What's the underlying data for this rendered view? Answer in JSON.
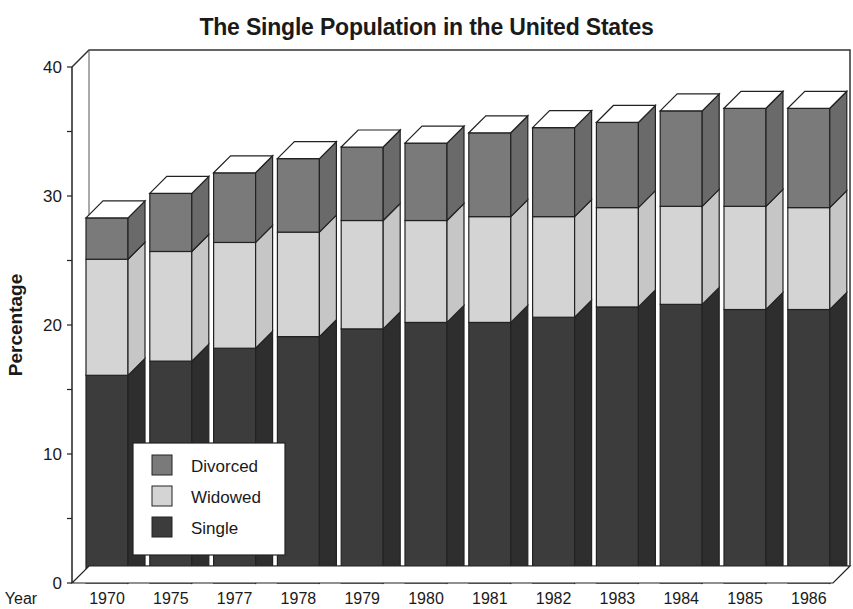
{
  "chart_data": {
    "type": "bar",
    "stacked": true,
    "three_d": true,
    "title": "The Single Population in the United States",
    "xlabel": "Year",
    "ylabel": "Percentage",
    "ylim": [
      0,
      40
    ],
    "yticks": [
      0,
      10,
      20,
      30,
      40
    ],
    "grid": false,
    "legend_position": "lower-left inside plot",
    "categories": [
      "1970",
      "1975",
      "1977",
      "1978",
      "1979",
      "1980",
      "1981",
      "1982",
      "1983",
      "1984",
      "1985",
      "1986"
    ],
    "series": [
      {
        "name": "Single",
        "color": "#3c3c3c",
        "side_color": "#2e2e2e",
        "values": [
          16.1,
          17.2,
          18.2,
          19.1,
          19.7,
          20.2,
          20.2,
          20.6,
          21.4,
          21.6,
          21.2,
          21.2
        ]
      },
      {
        "name": "Widowed",
        "color": "#d4d4d4",
        "side_color": "#c6c6c6",
        "values": [
          9.0,
          8.5,
          8.2,
          8.1,
          8.4,
          7.9,
          8.2,
          7.8,
          7.7,
          7.6,
          8.0,
          7.9
        ]
      },
      {
        "name": "Divorced",
        "color": "#7a7a7a",
        "side_color": "#6a6a6a",
        "values": [
          3.2,
          4.5,
          5.4,
          5.7,
          5.7,
          6.0,
          6.5,
          6.9,
          6.6,
          7.4,
          7.6,
          7.7
        ]
      }
    ],
    "totals": [
      28.3,
      30.2,
      31.8,
      32.9,
      33.8,
      34.1,
      34.9,
      35.3,
      35.7,
      36.6,
      36.8,
      36.8
    ],
    "legend": [
      "Divorced",
      "Widowed",
      "Single"
    ]
  }
}
